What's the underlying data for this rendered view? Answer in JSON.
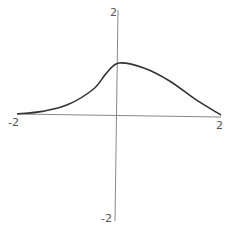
{
  "chart_data": {
    "type": "line",
    "title": "",
    "xlabel": "",
    "ylabel": "",
    "xlim": [
      -2,
      2
    ],
    "ylim": [
      -2,
      2
    ],
    "grid": false,
    "legend": null,
    "x_tick_labels": [
      "-2",
      "2"
    ],
    "y_tick_labels": [
      "2",
      "-2"
    ],
    "series": [
      {
        "name": "f(x)",
        "x": [
          -2,
          -1.5,
          -1,
          -0.5,
          -0.25,
          0,
          0.5,
          1,
          1.5,
          2
        ],
        "y": [
          0.02,
          0.07,
          0.2,
          0.5,
          0.8,
          1.0,
          0.9,
          0.65,
          0.3,
          0.0
        ]
      }
    ],
    "colors": {
      "curve": "#333333",
      "axes": "#888888",
      "labels": "#555555"
    }
  }
}
